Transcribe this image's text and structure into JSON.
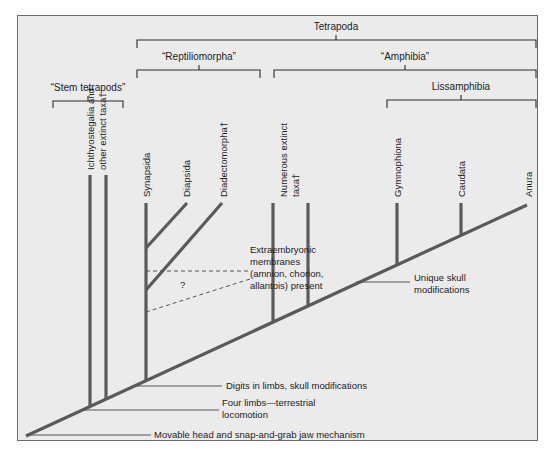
{
  "groups": {
    "tetrapoda": "Tetrapoda",
    "reptiliomorpha": "“Reptiliomorpha”",
    "amphibia": "“Amphibia”",
    "lissamphibia": "Lissamphibia",
    "stem_tetrapods": "“Stem tetrapods”"
  },
  "taxa": {
    "ichthyostegalia_line1": "Ichthyostegalia  and",
    "ichthyostegalia_line2": "other extinct taxa†",
    "synapsida": "Synapsida",
    "diapsida": "Diapsida",
    "diadectomorpha": "Diadectomorpha†",
    "numerous_line1": "Numerous extinct",
    "numerous_line2": "taxa†",
    "gymnophiona": "Gymnophiona",
    "caudata": "Caudata",
    "anura": "Anura"
  },
  "characters": {
    "extraembryonic_1": "Extraembryonic",
    "extraembryonic_2": "membranes",
    "extraembryonic_3": "(amnion, chorion,",
    "extraembryonic_4": "allantois) present",
    "question_mark": "?",
    "unique_skull_1": "Unique skull",
    "unique_skull_2": "modifications",
    "digits": "Digits in limbs, skull modifications",
    "four_limbs_1": "Four limbs—terrestrial",
    "four_limbs_2": "locomotion",
    "movable_head": "Movable head and snap-and-grab jaw mechanism"
  },
  "colors": {
    "background": "#ebebeb",
    "branch": "#5a5a5c",
    "text": "#1c1c1c"
  }
}
